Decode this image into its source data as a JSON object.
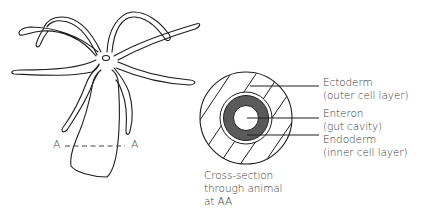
{
  "figure": {
    "section_markers": {
      "left": "A",
      "right": "A"
    },
    "labels": [
      {
        "id": "ectoderm",
        "name": "Ectoderm",
        "detail": "(outer cell layer)"
      },
      {
        "id": "enteron",
        "name": "Enteron",
        "detail": "(gut cavity)"
      },
      {
        "id": "endoderm",
        "name": "Endoderm",
        "detail": "(inner cell layer)"
      }
    ],
    "caption": {
      "line1": "Cross-section",
      "line2": "through animal",
      "line3": "at AA"
    },
    "colors": {
      "stroke": "#1e1e1e",
      "endoderm_fill": "#5a5a5a",
      "background": "#ffffff",
      "text": "#3a3a3a"
    }
  }
}
